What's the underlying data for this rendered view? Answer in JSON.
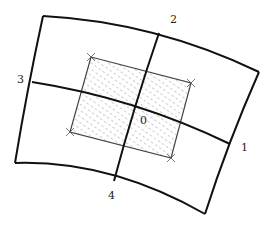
{
  "diagram": {
    "title": "",
    "type": "curvilinear-grid-cell",
    "colors": {
      "outline": "#111111",
      "rect_stroke": "#444444",
      "hatch": "#888888",
      "label": "#222222",
      "background": "#ffffff"
    },
    "labels": {
      "center": "0",
      "right": "1",
      "top": "2",
      "left": "3",
      "bottom": "4"
    },
    "outer_quad": {
      "top_left": [
        43,
        16
      ],
      "top_right": [
        259,
        72
      ],
      "bottom_right": [
        205,
        214
      ],
      "bottom_left": [
        15,
        163
      ]
    },
    "grid_lines": {
      "line_1_3": {
        "from": [
          32,
          82
        ],
        "via": [
          135,
          104
        ],
        "to": [
          230,
          144
        ]
      },
      "line_2_4": {
        "from": [
          159,
          33
        ],
        "via": [
          135,
          104
        ],
        "to": [
          114,
          181
        ]
      }
    },
    "hatched_rect": {
      "corners": [
        [
          91,
          57
        ],
        [
          191,
          83
        ],
        [
          171,
          158
        ],
        [
          70,
          132
        ]
      ],
      "corner_markers": "x"
    }
  }
}
